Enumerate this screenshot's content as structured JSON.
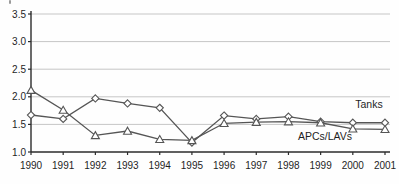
{
  "chart_data": {
    "type": "line",
    "title": "",
    "xlabel": "",
    "ylabel": "",
    "x": [
      1990,
      1991,
      1992,
      1993,
      1994,
      1995,
      1996,
      1997,
      1998,
      1999,
      2000,
      2001
    ],
    "x_tick_labels": [
      "1990",
      "1991",
      "1992",
      "1993",
      "1994",
      "1995",
      "1996",
      "1997",
      "1998",
      "1999",
      "2000",
      "2001"
    ],
    "ylim": [
      1.0,
      3.5
    ],
    "ytick_step": 0.5,
    "y_tick_labels": [
      "1.0",
      "1.5",
      "2.0",
      "2.5",
      "3.0",
      "3.5"
    ],
    "grid": true,
    "legend_position": "direct-labels-right",
    "series": [
      {
        "name": "Tanks",
        "marker": "diamond",
        "values": [
          1.67,
          1.6,
          1.97,
          1.88,
          1.8,
          1.17,
          1.66,
          1.6,
          1.64,
          1.55,
          1.53,
          1.53
        ],
        "label": "Tanks",
        "label_x": 369,
        "label_y": 108
      },
      {
        "name": "APCs/LAVs",
        "marker": "triangle",
        "values": [
          2.12,
          1.76,
          1.3,
          1.38,
          1.23,
          1.21,
          1.52,
          1.54,
          1.55,
          1.53,
          1.42,
          1.41
        ],
        "label": "APCs/LAVs",
        "label_x": 325,
        "label_y": 140
      }
    ],
    "colors": {
      "line": "#555555",
      "marker_fill": "#ffffff",
      "marker_stroke": "#555555",
      "grid": "#c6c6c6",
      "axis": "#2b2b2b",
      "text": "#1f1f1f",
      "background": "#fefefe"
    }
  }
}
